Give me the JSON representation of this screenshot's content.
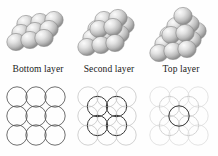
{
  "figure": {
    "background_color": "#fefefe",
    "panels": [
      {
        "id": "bottom-layer",
        "caption": "Bottom layer",
        "stack": {
          "description": "3 by 3 array of spheres, one layer high, shown in perspective",
          "sphere_count": 9,
          "layers": [
            {
              "level": 1,
              "rows": 3,
              "cols": 3,
              "count": 9
            }
          ]
        },
        "packing": {
          "description": "3 by 3 square array of touching circles",
          "base_circles": 9,
          "base_stroke": "#555555",
          "base_opacity": 1.0,
          "highlight_circles": 0,
          "highlight_stroke": "#333333",
          "interstitial_circles": 0,
          "interstitial_opacity": 0.0
        }
      },
      {
        "id": "second-layer",
        "caption": "Second layer",
        "stack": {
          "description": "3 by 3 bottom layer with a 2 by 2 second layer nested in the hollows",
          "sphere_count": 13,
          "layers": [
            {
              "level": 1,
              "rows": 3,
              "cols": 3,
              "count": 9
            },
            {
              "level": 2,
              "rows": 2,
              "cols": 2,
              "count": 4
            }
          ]
        },
        "packing": {
          "description": "Faint 3 by 3 base grid with 4 dark circles seated in the interstices",
          "base_circles": 9,
          "base_stroke": "#9a9a9a",
          "base_opacity": 0.55,
          "highlight_circles": 4,
          "highlight_stroke": "#3a3a3a",
          "interstitial_circles": 0,
          "interstitial_opacity": 0.0
        }
      },
      {
        "id": "top-layer",
        "caption": "Top layer",
        "stack": {
          "description": "Three stacked layers forming a pyramid: 9 + 4 + 1 spheres",
          "sphere_count": 14,
          "layers": [
            {
              "level": 1,
              "rows": 3,
              "cols": 3,
              "count": 9
            },
            {
              "level": 2,
              "rows": 2,
              "cols": 2,
              "count": 4
            },
            {
              "level": 3,
              "rows": 1,
              "cols": 1,
              "count": 1
            }
          ]
        },
        "packing": {
          "description": "Very faint 3 by 3 base grid plus 4 faint second layer circles, with a single dark circle at the centre",
          "base_circles": 9,
          "base_stroke": "#c8c8c8",
          "base_opacity": 0.38,
          "highlight_circles": 1,
          "highlight_stroke": "#3a3a3a",
          "interstitial_circles": 4,
          "interstitial_opacity": 0.45
        }
      }
    ],
    "colors": {
      "sphere_light": "#f2f2f2",
      "sphere_mid": "#c9c9c9",
      "sphere_dark": "#8e8e8e",
      "sphere_outline": "#7a7a7a",
      "caption_text": "#1a1a1a"
    }
  }
}
